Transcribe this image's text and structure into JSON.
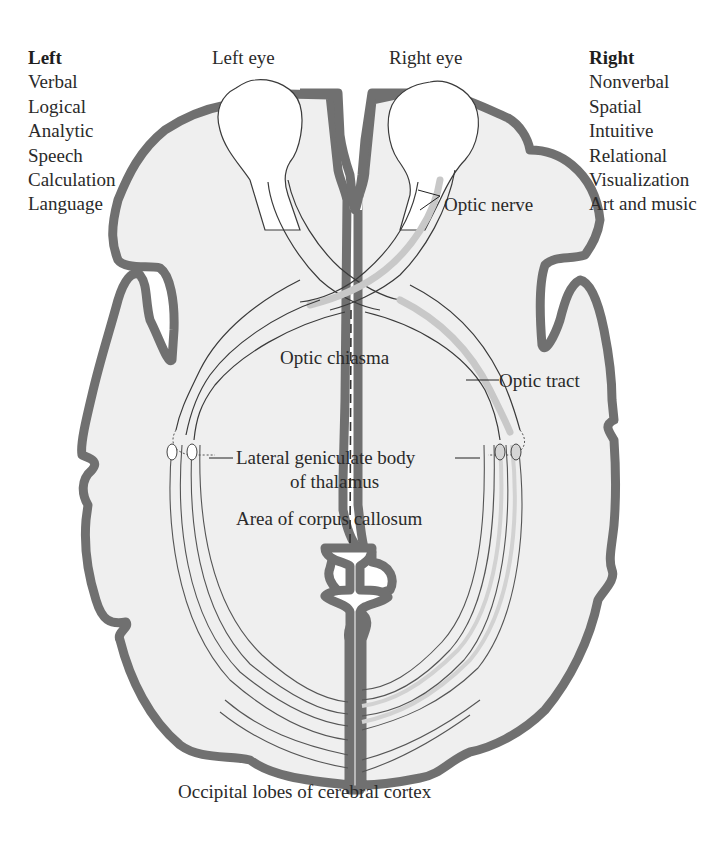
{
  "left_hemisphere": {
    "heading": "Left",
    "functions": [
      "Verbal",
      "Logical",
      "Analytic",
      "Speech",
      "Calculation",
      "Language"
    ]
  },
  "right_hemisphere": {
    "heading": "Right",
    "functions": [
      "Nonverbal",
      "Spatial",
      "Intuitive",
      "Relational",
      "Visualization",
      "Art and music"
    ]
  },
  "labels": {
    "left_eye": "Left eye",
    "right_eye": "Right eye",
    "optic_nerve": "Optic nerve",
    "optic_chiasma": "Optic chiasma",
    "optic_tract": "Optic tract",
    "lateral_geniculate_line1": "Lateral geniculate body",
    "lateral_geniculate_line2": "of thalamus",
    "corpus_callosum": "Area of corpus callosum",
    "occipital_lobes": "Occipital lobes of cerebral cortex"
  },
  "colors": {
    "cortex_outline": "#707070",
    "brain_fill": "#efefef",
    "nerve_highlight": "#c8c8c8",
    "text": "#2a2a2a"
  }
}
